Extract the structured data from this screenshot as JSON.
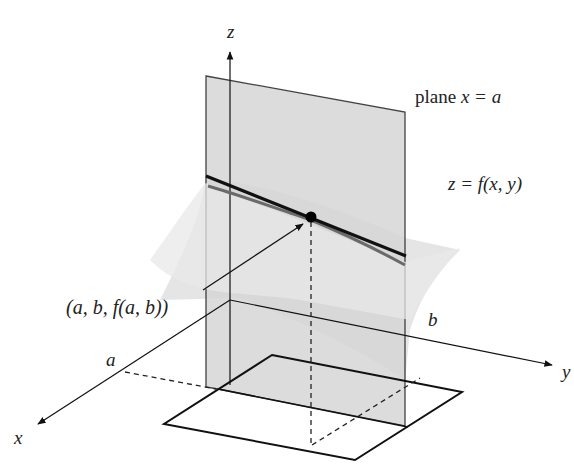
{
  "diagram": {
    "type": "3d-partial-derivative-illustration",
    "axes": {
      "x_label": "x",
      "y_label": "y",
      "z_label": "z"
    },
    "labels": {
      "plane": "plane x = a",
      "plane_prefix": "plane ",
      "plane_eq": "x = a",
      "surface": "z = f(x, y)",
      "point": "(a, b, f(a, b))",
      "a_tick": "a",
      "b_tick": "b"
    },
    "colors": {
      "plane_fill": "#d4d4d4",
      "surface_fill": "#e2e2e2",
      "tangent_line": "#111111",
      "trace_curve": "#6a6a6a",
      "ink": "#111111"
    }
  }
}
